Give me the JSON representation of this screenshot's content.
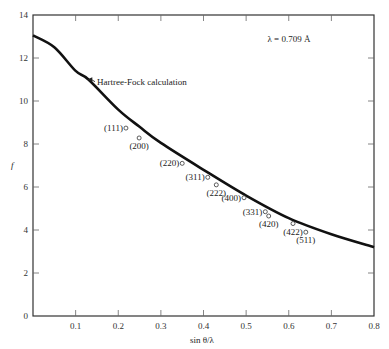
{
  "chart_data": {
    "type": "line",
    "title": "",
    "xlabel": "sin θ/λ",
    "ylabel": "f",
    "xlim": [
      0,
      0.8
    ],
    "ylim": [
      0,
      14
    ],
    "grid": false,
    "x_ticks": [
      "0.1",
      "0.2",
      "0.3",
      "0.4",
      "0.5",
      "0.6",
      "0.7",
      "0.8"
    ],
    "y_ticks": [
      "0",
      "2",
      "4",
      "6",
      "8",
      "10",
      "12",
      "14"
    ],
    "annotations": [
      {
        "text": "λ = 0.709 Å",
        "x": 0.55,
        "y": 12.9
      },
      {
        "text": "Hartree-Fock calculation",
        "x": 0.15,
        "y": 10.9,
        "arrow_to": [
          0.125,
          11.0
        ]
      }
    ],
    "series": [
      {
        "name": "Hartree-Fock calculation",
        "style": "line",
        "x": [
          0,
          0.05,
          0.1,
          0.13,
          0.2,
          0.25,
          0.3,
          0.4,
          0.5,
          0.6,
          0.7,
          0.8
        ],
        "y": [
          13.05,
          12.5,
          11.4,
          11.0,
          9.6,
          8.8,
          8.05,
          6.8,
          5.6,
          4.55,
          3.8,
          3.2
        ]
      },
      {
        "name": "Measured reflections",
        "style": "scatter",
        "points": [
          {
            "label": "(111)",
            "x": 0.218,
            "y": 8.74
          },
          {
            "label": "(200)",
            "x": 0.249,
            "y": 8.28
          },
          {
            "label": "(220)",
            "x": 0.35,
            "y": 7.1
          },
          {
            "label": "(311)",
            "x": 0.41,
            "y": 6.45
          },
          {
            "label": "(222)",
            "x": 0.43,
            "y": 6.1
          },
          {
            "label": "(400)",
            "x": 0.495,
            "y": 5.5
          },
          {
            "label": "(331)",
            "x": 0.545,
            "y": 4.85
          },
          {
            "label": "(420)",
            "x": 0.553,
            "y": 4.65
          },
          {
            "label": "(422)",
            "x": 0.61,
            "y": 4.3
          },
          {
            "label": "(511)",
            "x": 0.64,
            "y": 3.9
          }
        ]
      }
    ]
  }
}
